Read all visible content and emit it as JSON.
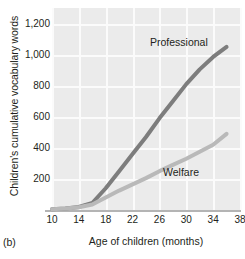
{
  "panel": {
    "tag": "(b)"
  },
  "chart_data": {
    "type": "line",
    "title": "",
    "xlabel": "Age of children (months)",
    "ylabel": "Children's cumulative vocabulary words",
    "xlim": [
      10,
      38
    ],
    "ylim": [
      0,
      1300
    ],
    "grid": true,
    "legend_position": "inline-annotation",
    "xticks": [
      "10",
      "14",
      "18",
      "22",
      "26",
      "30",
      "34",
      "38"
    ],
    "xtick_values": [
      10,
      14,
      18,
      22,
      26,
      30,
      34,
      38
    ],
    "yticks": [
      "200",
      "400",
      "600",
      "800",
      "1,000",
      "1,200"
    ],
    "ytick_values": [
      200,
      400,
      600,
      800,
      1000,
      1200
    ],
    "x": [
      10,
      12,
      14,
      16,
      18,
      20,
      22,
      24,
      26,
      28,
      30,
      32,
      34,
      36
    ],
    "series": [
      {
        "name": "Professional",
        "color": "#7d7d7d",
        "values": [
          5,
          10,
          20,
          45,
          140,
          250,
          360,
          470,
          590,
          700,
          810,
          905,
          985,
          1050
        ]
      },
      {
        "name": "Welfare",
        "color": "#b9b9b9",
        "values": [
          5,
          10,
          18,
          35,
          80,
          125,
          165,
          205,
          250,
          290,
          330,
          375,
          420,
          490
        ]
      }
    ],
    "annotations": [
      {
        "text": "Professional",
        "x": 28,
        "y": 1130
      },
      {
        "text": "Welfare",
        "x": 29,
        "y": 300
      }
    ]
  },
  "colors": {
    "plot_background": "#ebebeb",
    "gridline": "#fbfbfb",
    "axis": "#b4b4b4",
    "text": "#231f20",
    "professional_line": "#7d7d7d",
    "welfare_line": "#b9b9b9"
  }
}
